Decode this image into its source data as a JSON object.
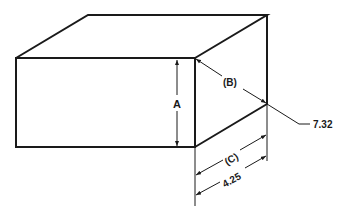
{
  "diagram": {
    "type": "isometric-box-dimension-drawing",
    "line_color": "#1a1a1a",
    "labels": {
      "height": "A",
      "diagonal": "(B)",
      "depth_label": "(C)",
      "depth_value": "4.25",
      "diagonal_value": "7.32"
    }
  }
}
